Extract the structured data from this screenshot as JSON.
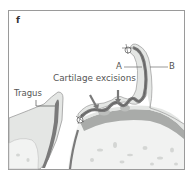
{
  "figure": {
    "panel_letter": "f",
    "labels": {
      "tragus": "Tragus",
      "cartilage_excisions": "Cartilage excisions",
      "a": "A",
      "b": "B"
    },
    "colors": {
      "frame": "#9a9a9a",
      "skin": "#e4e6e4",
      "cartilage": "#7a7a7a",
      "bone_band": "#a9aba9",
      "bone_fill": "#f1f2f1",
      "text": "#555555"
    }
  }
}
